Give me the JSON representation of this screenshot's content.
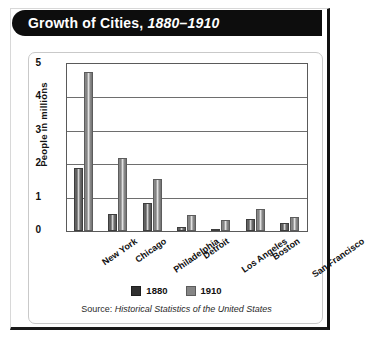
{
  "title": {
    "main": "Growth of Cities,",
    "era": "1880–1910"
  },
  "source": {
    "prefix": "Source: ",
    "title": "Historical Statistics of the United States"
  },
  "legend": {
    "items": [
      {
        "label": "1880",
        "color": "#303030"
      },
      {
        "label": "1910",
        "color": "#858585"
      }
    ]
  },
  "chart_data": {
    "type": "bar",
    "title": "Growth of Cities, 1880–1910",
    "xlabel": "",
    "ylabel": "People in millions",
    "ylim": [
      0,
      5
    ],
    "yticks": [
      "0",
      "1",
      "2",
      "3",
      "4",
      "5"
    ],
    "grid": true,
    "legend_position": "bottom-center",
    "categories": [
      "New York",
      "Chicago",
      "Philadelphia",
      "Detroit",
      "Los Angeles",
      "Boston",
      "San Francisco"
    ],
    "series": [
      {
        "name": "1880",
        "color": "#303030",
        "values": [
          1.9,
          0.5,
          0.85,
          0.12,
          0.01,
          0.36,
          0.23
        ]
      },
      {
        "name": "1910",
        "color": "#858585",
        "values": [
          4.77,
          2.18,
          1.55,
          0.47,
          0.32,
          0.67,
          0.42
        ]
      }
    ],
    "source": "Source: Historical Statistics of the United States"
  }
}
